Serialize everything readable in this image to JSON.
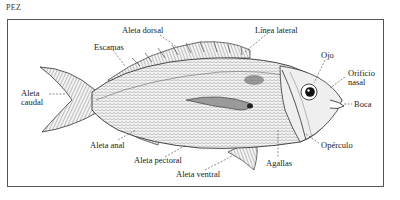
{
  "title": "PEZ",
  "diagram": {
    "labels": {
      "aleta_dorsal": "Aleta dorsal",
      "linea_lateral": "Línea lateral",
      "escamas": "Escamas",
      "ojo": "Ojo",
      "orificio_nasal_1": "Orificio",
      "orificio_nasal_2": "nasal",
      "aleta_caudal_1": "Aleta",
      "aleta_caudal_2": "caudal",
      "boca": "Boca",
      "aleta_anal": "Aleta anal",
      "aleta_pectoral": "Aleta pectoral",
      "operculo": "Opérculo",
      "agallas": "Agallas",
      "aleta_ventral": "Aleta ventral"
    },
    "colors": {
      "ink": "#222222",
      "frame": "#555555",
      "body_fill": "#e9e9e9",
      "background": "#ffffff"
    }
  }
}
